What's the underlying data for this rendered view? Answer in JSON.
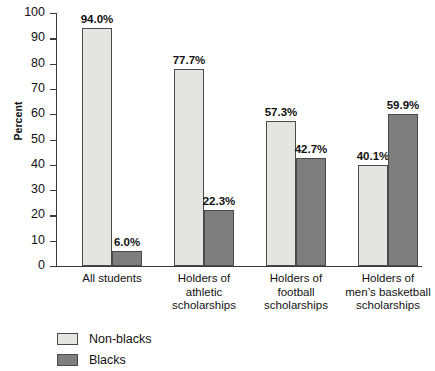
{
  "chart_data": {
    "type": "bar",
    "title": "",
    "xlabel": "",
    "ylabel": "Percent",
    "ylim": [
      0,
      100
    ],
    "ytick_step": 10,
    "yticks": [
      100,
      90,
      80,
      70,
      60,
      50,
      40,
      30,
      20,
      10,
      0
    ],
    "grid": false,
    "legend_position": "bottom-left",
    "orientation": "vertical",
    "grouping": "grouped",
    "categories": [
      "All students",
      "Holders of athletic scholarships",
      "Holders of football scholarships",
      "Holders of men’s basketball scholarships"
    ],
    "category_lines": [
      [
        "All students"
      ],
      [
        "Holders of",
        "athletic",
        "scholarships"
      ],
      [
        "Holders of",
        "football",
        "scholarships"
      ],
      [
        "Holders of",
        "men’s basketball",
        "scholarships"
      ]
    ],
    "series": [
      {
        "name": "Non-blacks",
        "color": "#e4e4e2",
        "values": [
          94.0,
          77.7,
          57.3,
          40.1
        ],
        "labels": [
          "94.0%",
          "77.7%",
          "57.3%",
          "40.1%"
        ]
      },
      {
        "name": "Blacks",
        "color": "#7e7e7e",
        "values": [
          6.0,
          22.3,
          42.7,
          59.9
        ],
        "labels": [
          "6.0%",
          "22.3%",
          "42.7%",
          "59.9%"
        ]
      }
    ]
  },
  "axis": {
    "y_title": "Percent",
    "tick_labels": [
      "100",
      "90",
      "80",
      "70",
      "60",
      "50",
      "40",
      "30",
      "20",
      "10",
      "0"
    ]
  },
  "legend": {
    "items": [
      {
        "label": "Non-blacks",
        "color": "#e4e4e2"
      },
      {
        "label": "Blacks",
        "color": "#7e7e7e"
      }
    ]
  },
  "colors": {
    "non_blacks": "#e4e4e2",
    "blacks": "#7e7e7e",
    "axis": "#3a3a3a",
    "bar_outline": "#4a4a4a",
    "text": "#111111",
    "background": "#ffffff"
  }
}
